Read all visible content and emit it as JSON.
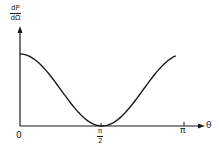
{
  "chart_data": {
    "type": "line",
    "title": "",
    "xlabel": "θ",
    "ylabel": "dP/dΩ",
    "ylabel_parts": {
      "numerator": "dP",
      "denominator": "dΩ"
    },
    "xticks": [
      "0",
      "π/2",
      "π"
    ],
    "xtick_parts": {
      "zero": "0",
      "half_num": "π",
      "half_den": "2",
      "pi": "π"
    },
    "xlim": [
      0,
      3.1416
    ],
    "ylim": [
      0,
      1.4
    ],
    "grid": false,
    "legend": null,
    "series": [
      {
        "name": "dP/dΩ ∝ cos²θ",
        "x": [
          0,
          0.3927,
          0.7854,
          1.1781,
          1.5708,
          1.9635,
          2.3562,
          2.7489,
          2.9845
        ],
        "values": [
          1.0,
          0.854,
          0.5,
          0.146,
          0.0,
          0.146,
          0.5,
          0.854,
          0.976
        ]
      }
    ],
    "annotations": []
  },
  "colors": {
    "line": "#1a1a1a",
    "background": "#ffffff"
  }
}
